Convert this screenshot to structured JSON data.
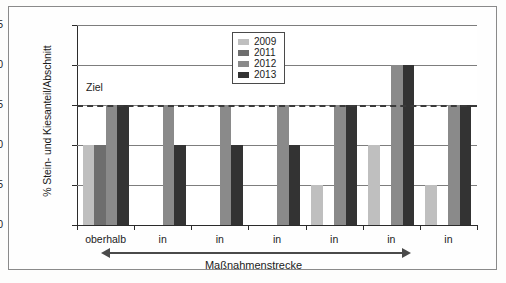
{
  "chart_data": {
    "type": "bar",
    "title": "",
    "xlabel": "Maßnahmenstrecke",
    "ylabel": "% Stein- und Kiesanteil/Abschnitt",
    "ylim": [
      0,
      25
    ],
    "yticks": [
      0,
      5,
      10,
      15,
      20,
      25
    ],
    "ytick_labels": [
      "0",
      "5",
      "10",
      "15",
      "20",
      "25"
    ],
    "grid": true,
    "legend_position": "top-center",
    "categories": [
      "oberhalb",
      "in",
      "in",
      "in",
      "in",
      "in",
      "in"
    ],
    "series": [
      {
        "name": "2009",
        "color": "#bfbfbf",
        "values": [
          10,
          null,
          null,
          null,
          5,
          10,
          5
        ]
      },
      {
        "name": "2011",
        "color": "#6e6e6e",
        "values": [
          10,
          null,
          null,
          null,
          null,
          null,
          null
        ]
      },
      {
        "name": "2012",
        "color": "#8a8a8a",
        "values": [
          15,
          15,
          15,
          15,
          15,
          20,
          15
        ]
      },
      {
        "name": "2013",
        "color": "#333333",
        "values": [
          15,
          10,
          10,
          10,
          15,
          20,
          15
        ]
      }
    ],
    "annotations": [
      {
        "name": "ziel-line",
        "label": "Ziel",
        "value": 15,
        "style": "dashed",
        "color": "#3a3a3a"
      }
    ],
    "axis_arrow": {
      "label": "Maßnahmenstrecke",
      "double_headed": true
    }
  },
  "legend": {
    "entries": [
      {
        "label": "2009",
        "color": "#bfbfbf"
      },
      {
        "label": "2011",
        "color": "#6e6e6e"
      },
      {
        "label": "2012",
        "color": "#8a8a8a"
      },
      {
        "label": "2013",
        "color": "#333333"
      }
    ]
  },
  "axes": {
    "y_title": "% Stein- und Kiesanteil/Abschnitt",
    "x_title": "Maßnahmenstrecke",
    "y_ticks": [
      "0",
      "5",
      "10",
      "15",
      "20",
      "25"
    ],
    "x_categories": [
      "oberhalb",
      "in",
      "in",
      "in",
      "in",
      "in",
      "in"
    ]
  },
  "annotation": {
    "ziel": "Ziel"
  }
}
